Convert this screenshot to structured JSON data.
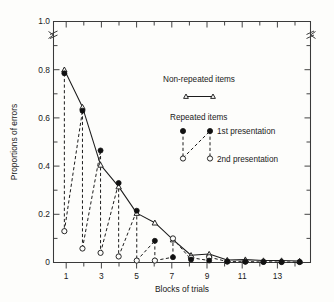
{
  "chart_data": {
    "type": "line",
    "title": "",
    "xlabel": "Blocks of trials",
    "ylabel": "Proportions of errors",
    "xlim": [
      0.4,
      14.6
    ],
    "ylim": [
      0,
      1.0
    ],
    "grid": false,
    "axis_break": {
      "axis": "y",
      "between": [
        0.82,
        0.98
      ],
      "note": "zigzag break marks on left and right spines above 0.8"
    },
    "legend": {
      "position": "upper-right-inside",
      "entries": [
        {
          "label": "Non-repeated items",
          "marker": "open-triangle",
          "line": "solid"
        },
        {
          "label": "Repeated items",
          "sub_entries": [
            {
              "label": "1st presentation",
              "marker": "filled-circle",
              "line": "dashed"
            },
            {
              "label": "2nd presentation",
              "marker": "open-circle",
              "line": "dashed"
            }
          ]
        }
      ]
    },
    "x_ticks_major": [
      1,
      3,
      5,
      7,
      9,
      11,
      13
    ],
    "x_tick_labels": [
      "1",
      "3",
      "5",
      "7",
      "9",
      "11",
      "13"
    ],
    "x_ticks_minor": [
      2,
      4,
      6,
      8,
      10,
      12,
      14
    ],
    "y_ticks_major": [
      0,
      0.2,
      0.4,
      0.6,
      0.8,
      1.0
    ],
    "y_tick_labels": [
      "0",
      "0.2",
      "0.4",
      "0.6",
      "0.8",
      "1.0"
    ],
    "y_ticks_minor": [
      0.1,
      0.3,
      0.5,
      0.7,
      0.9
    ],
    "x": [
      1,
      2,
      3,
      4,
      5,
      6,
      7,
      8,
      9,
      10,
      11,
      12,
      13,
      14
    ],
    "series": [
      {
        "name": "Non-repeated items",
        "marker": "open-triangle",
        "line": "solid",
        "values": [
          0.8,
          0.645,
          0.405,
          0.315,
          0.205,
          0.165,
          0.095,
          0.03,
          0.035,
          0.01,
          0.012,
          0.008,
          0.008,
          0.006
        ]
      },
      {
        "name": "Repeated items - 1st presentation",
        "marker": "filled-circle",
        "line": "dashed",
        "values": [
          0.785,
          0.63,
          0.465,
          0.33,
          0.215,
          0.09,
          0.022,
          0.012,
          0.008,
          0.004,
          0.003,
          0.002,
          0.002,
          0.002
        ]
      },
      {
        "name": "Repeated items - 2nd presentation",
        "marker": "open-circle",
        "line": "dashed",
        "values": [
          0.13,
          0.058,
          0.04,
          0.025,
          0.008,
          0.008,
          0.1,
          0.02,
          0.022,
          0.004,
          0.004,
          0.003,
          0.002,
          0.002
        ]
      }
    ]
  },
  "axes": {
    "y_label": "Proportions of errors",
    "x_label": "Blocks of trials"
  },
  "legend": {
    "nonrepeated_title": "Non-repeated items",
    "repeated_title": "Repeated items",
    "first_presentation": "1st presentation",
    "second_presentation": "2nd presentation"
  },
  "colors": {
    "ink": "#1c1c1c",
    "axis": "#3a3a3a",
    "paper": "#fdfdfb"
  }
}
